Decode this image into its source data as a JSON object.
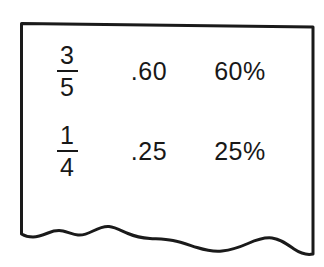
{
  "figure": {
    "kind": "torn-paper-note",
    "background_color": "#ffffff",
    "ink_color": "#181818",
    "border_color": "#1a1a1a"
  },
  "table": {
    "rows": [
      {
        "fraction": {
          "numerator": "3",
          "denominator": "5"
        },
        "decimal": ".60",
        "percent": "60%"
      },
      {
        "fraction": {
          "numerator": "1",
          "denominator": "4"
        },
        "decimal": ".25",
        "percent": "25%"
      }
    ]
  }
}
